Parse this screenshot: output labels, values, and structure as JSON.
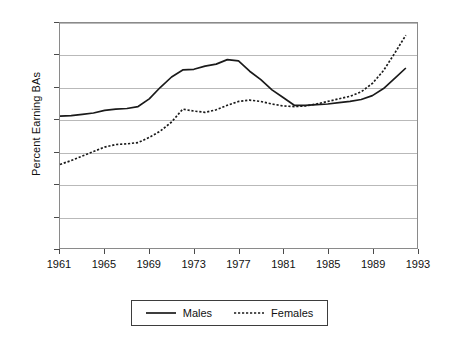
{
  "chart_data": {
    "type": "line",
    "title": "",
    "xlabel": "",
    "ylabel": "Percent Earning BAs",
    "xlim": [
      1961,
      1993
    ],
    "ylim": [
      0,
      35
    ],
    "grid": true,
    "legend_position": "bottom",
    "x_ticks": [
      "1961",
      "1965",
      "1969",
      "1973",
      "1977",
      "1981",
      "1985",
      "1989",
      "1993"
    ],
    "y_ticks": [
      "0",
      "5",
      "10",
      "15",
      "20",
      "25",
      "30",
      "35"
    ],
    "x": [
      1961,
      1962,
      1963,
      1964,
      1965,
      1966,
      1967,
      1968,
      1969,
      1970,
      1971,
      1972,
      1973,
      1974,
      1975,
      1976,
      1977,
      1978,
      1979,
      1980,
      1981,
      1982,
      1983,
      1984,
      1985,
      1986,
      1987,
      1988,
      1989,
      1990,
      1991,
      1992
    ],
    "series": [
      {
        "name": "Males",
        "style": "solid",
        "color": "#1a1a1a",
        "values": [
          20.5,
          20.6,
          20.8,
          21.0,
          21.4,
          21.6,
          21.7,
          22.0,
          23.2,
          25.0,
          26.6,
          27.7,
          27.8,
          28.3,
          28.6,
          29.3,
          29.1,
          27.5,
          26.2,
          24.6,
          23.4,
          22.2,
          22.2,
          22.3,
          22.4,
          22.6,
          22.8,
          23.1,
          23.7,
          24.8,
          26.4,
          28.0
        ]
      },
      {
        "name": "Females",
        "style": "dotted",
        "color": "#1a1a1a",
        "values": [
          13.0,
          13.6,
          14.3,
          15.0,
          15.7,
          16.1,
          16.2,
          16.4,
          17.2,
          18.2,
          19.6,
          21.6,
          21.3,
          21.1,
          21.5,
          22.2,
          22.8,
          23.0,
          22.8,
          22.4,
          22.1,
          22.0,
          22.1,
          22.4,
          22.8,
          23.2,
          23.6,
          24.3,
          25.6,
          27.6,
          30.3,
          33.1
        ]
      }
    ]
  },
  "legend": {
    "entries": [
      {
        "label": "Males",
        "style": "solid"
      },
      {
        "label": "Females",
        "style": "dotted"
      }
    ]
  }
}
